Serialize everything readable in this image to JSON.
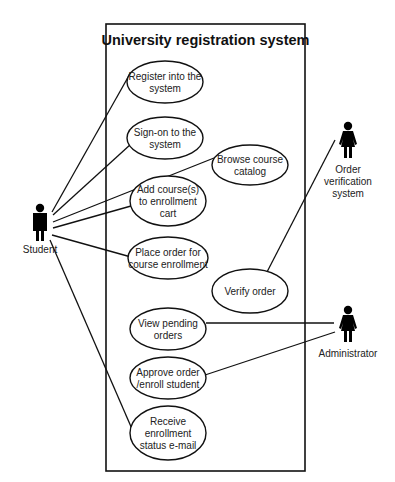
{
  "diagram": {
    "type": "uml-use-case",
    "system": {
      "title": "University registration system"
    },
    "actors": [
      {
        "id": "student",
        "label": [
          "Student"
        ],
        "figure": "male"
      },
      {
        "id": "order_verification_system",
        "label": [
          "Order",
          "verification",
          "system"
        ],
        "figure": "female"
      },
      {
        "id": "administrator",
        "label": [
          "Administrator"
        ],
        "figure": "female"
      }
    ],
    "use_cases": [
      {
        "id": "register",
        "lines": [
          "Register into the",
          "system"
        ]
      },
      {
        "id": "signon",
        "lines": [
          "Sign-on to the",
          "system"
        ]
      },
      {
        "id": "browse",
        "lines": [
          "Browse course",
          "catalog"
        ]
      },
      {
        "id": "add_course",
        "lines": [
          "Add course(s)",
          "to enrollment",
          "cart"
        ]
      },
      {
        "id": "place_order",
        "lines": [
          "Place order for",
          "course enrollment"
        ]
      },
      {
        "id": "verify",
        "lines": [
          "Verify order"
        ]
      },
      {
        "id": "view_pending",
        "lines": [
          "View pending",
          "orders"
        ]
      },
      {
        "id": "approve",
        "lines": [
          "Approve order",
          "/enroll student"
        ]
      },
      {
        "id": "receive",
        "lines": [
          "Receive",
          "enrollment",
          "status e-mail"
        ]
      }
    ],
    "associations": [
      {
        "actor": "student",
        "use_case": "register"
      },
      {
        "actor": "student",
        "use_case": "signon"
      },
      {
        "actor": "student",
        "use_case": "browse"
      },
      {
        "actor": "student",
        "use_case": "add_course"
      },
      {
        "actor": "student",
        "use_case": "place_order"
      },
      {
        "actor": "student",
        "use_case": "receive"
      },
      {
        "actor": "order_verification_system",
        "use_case": "verify"
      },
      {
        "actor": "administrator",
        "use_case": "view_pending"
      },
      {
        "actor": "administrator",
        "use_case": "approve"
      }
    ]
  }
}
